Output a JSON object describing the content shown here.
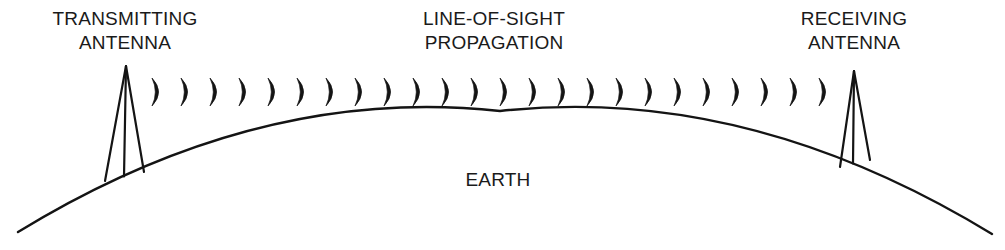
{
  "diagram": {
    "title_tx": "TRANSMITTING",
    "title_tx2": "ANTENNA",
    "title_center": "LINE-OF-SIGHT",
    "title_center2": "PROPAGATION",
    "title_rx": "RECEIVING",
    "title_rx2": "ANTENNA",
    "title_earth": "EARTH",
    "labels": {
      "transmitting_antenna_line1": "TRANSMITTING",
      "transmitting_antenna_line2": "ANTENNA",
      "propagation_line1": "LINE-OF-SIGHT",
      "propagation_line2": "PROPAGATION",
      "receiving_antenna_line1": "RECEIVING",
      "receiving_antenna_line2": "ANTENNA",
      "earth": "EARTH"
    },
    "colors": {
      "background": "#ffffff",
      "ink": "#1a1a1a",
      "stroke": "#141414"
    },
    "typography": {
      "label_font_size_px": 19
    },
    "earth_curve": {
      "left_x": 18,
      "left_y": 232,
      "apex_x": 500,
      "apex_y": 111,
      "right_x": 992,
      "right_y": 234,
      "stroke_width": 2.4
    },
    "transmitting_antenna": {
      "apex_x": 126,
      "apex_y": 66,
      "base_left_x": 105,
      "base_left_y": 181,
      "base_right_x": 144,
      "base_right_y": 172,
      "mast_x": 124,
      "stroke_width": 2.2
    },
    "receiving_antenna": {
      "apex_x": 854,
      "apex_y": 71,
      "base_left_x": 840,
      "base_left_y": 167,
      "base_right_x": 870,
      "base_right_y": 160,
      "mast_x": 853,
      "stroke_width": 2.2
    },
    "wave_arcs": {
      "icon": "crescent-wavefront-arc",
      "count": 24,
      "start_x": 152,
      "spacing_x": 29,
      "center_y": 92,
      "half_height": 14,
      "bow": 9,
      "thickness_max": 4.2,
      "description": "Sequence of crescent-shaped wavefront arcs opening leftward, travelling from transmitting antenna to receiving antenna"
    }
  }
}
